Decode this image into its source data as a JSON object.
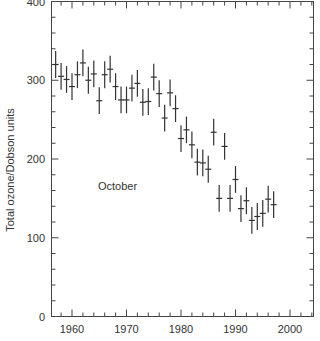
{
  "chart_data": {
    "type": "scatter",
    "title": "",
    "annotation": "October",
    "xlabel": "",
    "ylabel": "Total ozone/Dobson units",
    "xlim": [
      1956,
      2004.2
    ],
    "ylim": [
      0,
      400
    ],
    "x_ticks": [
      1960,
      1970,
      1980,
      1990,
      2000
    ],
    "y_ticks": [
      0,
      100,
      200,
      300,
      400
    ],
    "grid": false,
    "legend": null,
    "error_bars": true,
    "error_bar_halfwidth_du": 17,
    "x": [
      1957,
      1958,
      1959,
      1960,
      1961,
      1962,
      1963,
      1964,
      1965,
      1966,
      1967,
      1968,
      1969,
      1970,
      1971,
      1972,
      1973,
      1974,
      1975,
      1976,
      1977,
      1978,
      1979,
      1980,
      1981,
      1982,
      1983,
      1984,
      1985,
      1986,
      1987,
      1988,
      1989,
      1990,
      1991,
      1992,
      1993,
      1994,
      1995,
      1996,
      1997
    ],
    "values": [
      320,
      305,
      301,
      292,
      307,
      322,
      300,
      308,
      274,
      307,
      314,
      292,
      275,
      275,
      290,
      296,
      272,
      273,
      304,
      283,
      252,
      284,
      264,
      226,
      237,
      218,
      196,
      195,
      187,
      234,
      150,
      216,
      150,
      174,
      137,
      147,
      122,
      127,
      131,
      149,
      142
    ],
    "series": [
      {
        "name": "October total ozone",
        "x": [
          1957,
          1958,
          1959,
          1960,
          1961,
          1962,
          1963,
          1964,
          1965,
          1966,
          1967,
          1968,
          1969,
          1970,
          1971,
          1972,
          1973,
          1974,
          1975,
          1976,
          1977,
          1978,
          1979,
          1980,
          1981,
          1982,
          1983,
          1984,
          1985,
          1986,
          1987,
          1988,
          1989,
          1990,
          1991,
          1992,
          1993,
          1994,
          1995,
          1996,
          1997
        ],
        "values": [
          320,
          305,
          301,
          292,
          307,
          322,
          300,
          308,
          274,
          307,
          314,
          292,
          275,
          275,
          290,
          296,
          272,
          273,
          304,
          283,
          252,
          284,
          264,
          226,
          237,
          218,
          196,
          195,
          187,
          234,
          150,
          216,
          150,
          174,
          137,
          147,
          122,
          127,
          131,
          149,
          142
        ]
      }
    ],
    "colors": {
      "ink": "#333333",
      "axis": "#444444",
      "background": "#ffffff"
    }
  }
}
